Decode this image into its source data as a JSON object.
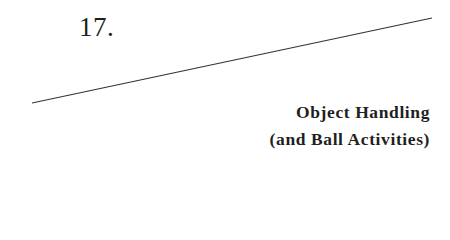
{
  "chapter": {
    "number": "17.",
    "title_line_1": "Object Handling",
    "title_line_2": "(and Ball Activities)"
  },
  "rule": {
    "x1": 32,
    "y1": 103,
    "x2": 432,
    "y2": 18,
    "color": "#333333"
  }
}
